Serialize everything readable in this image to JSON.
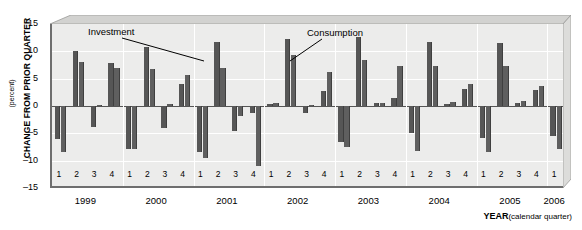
{
  "axis": {
    "ylabel_main": "CHANGE FROM PRIOR QUARTER",
    "ylabel_sub": "(percent)",
    "yticks": [
      "15",
      "10",
      "5",
      "0",
      "-5",
      "-10",
      "-15"
    ],
    "xlabel_bold": "YEAR",
    "xlabel_sub": "(calendar quarter)"
  },
  "annotations": [
    {
      "name": "investment",
      "text": "Investment"
    },
    {
      "name": "consumption",
      "text": "Consumption"
    }
  ],
  "colors": {
    "bar_investment": "#565656",
    "bar_consumption": "#5f5f5f",
    "plot_background": "#ececeb",
    "gridline": "#ffffff",
    "axis": "#6e6e6e"
  },
  "chart_data": {
    "type": "bar",
    "title": "",
    "xlabel": "YEAR (calendar quarter)",
    "ylabel": "CHANGE FROM PRIOR QUARTER (percent)",
    "ylim": [
      -15,
      15
    ],
    "yticks": [
      15,
      10,
      5,
      0,
      -5,
      -10,
      -15
    ],
    "grid": true,
    "legend": "annotated-inline",
    "categories": [
      "1999 Q1",
      "1999 Q2",
      "1999 Q3",
      "1999 Q4",
      "2000 Q1",
      "2000 Q2",
      "2000 Q3",
      "2000 Q4",
      "2001 Q1",
      "2001 Q2",
      "2001 Q3",
      "2001 Q4",
      "2002 Q1",
      "2002 Q2",
      "2002 Q3",
      "2002 Q4",
      "2003 Q1",
      "2003 Q2",
      "2003 Q3",
      "2003 Q4",
      "2004 Q1",
      "2004 Q2",
      "2004 Q3",
      "2004 Q4",
      "2005 Q1",
      "2005 Q2",
      "2005 Q3",
      "2005 Q4",
      "2006 Q1"
    ],
    "quarter_ticks": [
      "1",
      "2",
      "3",
      "4",
      "1",
      "2",
      "3",
      "4",
      "1",
      "2",
      "3",
      "4",
      "1",
      "2",
      "3",
      "4",
      "1",
      "2",
      "3",
      "4",
      "1",
      "2",
      "3",
      "4",
      "1",
      "2",
      "3",
      "4",
      "1"
    ],
    "year_ticks": [
      {
        "label": "1999",
        "start_index": 0,
        "span": 4
      },
      {
        "label": "2000",
        "start_index": 4,
        "span": 4
      },
      {
        "label": "2001",
        "start_index": 8,
        "span": 4
      },
      {
        "label": "2002",
        "start_index": 12,
        "span": 4
      },
      {
        "label": "2003",
        "start_index": 16,
        "span": 4
      },
      {
        "label": "2004",
        "start_index": 20,
        "span": 4
      },
      {
        "label": "2005",
        "start_index": 24,
        "span": 4
      },
      {
        "label": "2006",
        "start_index": 28,
        "span": 1
      }
    ],
    "series": [
      {
        "name": "Investment",
        "values": [
          -6.0,
          10.0,
          -3.8,
          7.8,
          -7.8,
          10.8,
          -4.0,
          4.0,
          -8.5,
          11.7,
          -4.5,
          -1.2,
          0.3,
          12.2,
          -1.3,
          2.8,
          -6.5,
          12.7,
          0.5,
          1.5,
          -5.0,
          11.7,
          0.3,
          3.2,
          -5.8,
          11.5,
          0.6,
          3.0,
          -5.5
        ]
      },
      {
        "name": "Consumption",
        "values": [
          -8.5,
          8.0,
          0.2,
          7.0,
          -7.8,
          6.8,
          0.4,
          5.6,
          -9.5,
          7.0,
          -1.8,
          -11.0,
          0.5,
          9.3,
          0.2,
          6.2,
          -7.5,
          8.5,
          0.6,
          7.3,
          -8.2,
          7.3,
          0.8,
          4.0,
          -8.5,
          7.3,
          1.0,
          3.6,
          -7.8
        ]
      }
    ]
  }
}
